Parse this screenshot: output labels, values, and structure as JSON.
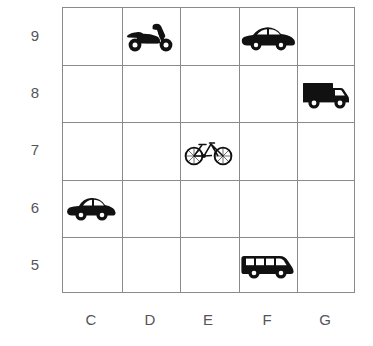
{
  "grid": {
    "column_labels": [
      "C",
      "D",
      "E",
      "F",
      "G"
    ],
    "row_labels": [
      "9",
      "8",
      "7",
      "6",
      "5"
    ],
    "line_color": "#8a8a8a",
    "label_color": "#555558",
    "background_color": "#ffffff",
    "columns": 5,
    "rows": 5
  },
  "items": [
    {
      "icon": "scooter-icon",
      "label": "scooter",
      "column": "D",
      "row": "9",
      "color": "#111111",
      "style": "solid"
    },
    {
      "icon": "sedan-car-icon",
      "label": "car",
      "column": "F",
      "row": "9",
      "color": "#111111",
      "style": "solid"
    },
    {
      "icon": "box-truck-icon",
      "label": "truck",
      "column": "G",
      "row": "8",
      "color": "#111111",
      "style": "solid"
    },
    {
      "icon": "bicycle-icon",
      "label": "bicycle",
      "column": "E",
      "row": "7",
      "color": "#111111",
      "style": "outline"
    },
    {
      "icon": "hatchback-car-icon",
      "label": "car",
      "column": "C",
      "row": "6",
      "color": "#111111",
      "style": "solid"
    },
    {
      "icon": "minibus-icon",
      "label": "bus",
      "column": "F",
      "row": "5",
      "color": "#111111",
      "style": "solid"
    }
  ]
}
